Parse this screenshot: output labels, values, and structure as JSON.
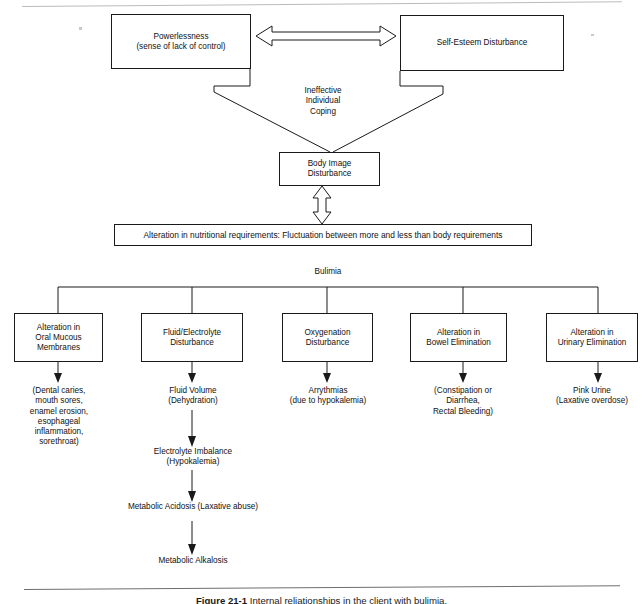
{
  "diagram": {
    "title_label": "Bulimia",
    "coping_label": "Ineffective\nIndividual\nCoping",
    "top_boxes": [
      {
        "name": "powerlessness",
        "text": "Powerlessness\n(sense of lack of control)"
      },
      {
        "name": "self-esteem-disturbance",
        "text": "Self-Esteem  Disturbance"
      }
    ],
    "body_image_box": {
      "name": "body-image-disturbance",
      "text": "Body Image\nDisturbance"
    },
    "nutrition_box": {
      "name": "alteration-nutritional-requirements",
      "text": "Alteration in nutritional requirements: Fluctuation between more and less than body requirements"
    },
    "branches": [
      {
        "name": "oral-mucous-membranes",
        "box": "Alteration in\nOral Mucous\nMembranes",
        "detail": "(Dental caries,\nmouth sores,\nenamel erosion,\nesophageal\ninflammation,\nsorethroat)"
      },
      {
        "name": "fluid-electrolyte-disturbance",
        "box": "Fluid/Electrolyte\nDisturbance",
        "detail": "Fluid Volume\n(Dehydration)"
      },
      {
        "name": "oxygenation-disturbance",
        "box": "Oxygenation\nDisturbance",
        "detail": "Arrythmias\n(due to hypokalemia)"
      },
      {
        "name": "bowel-elimination",
        "box": "Alteration in\nBowel Elimination",
        "detail": "(Constipation or\nDiarrhea,\nRectal Bleeding)"
      },
      {
        "name": "urinary-elimination",
        "box": "Alteration in\nUrinary Elimination",
        "detail": "Pink Urine\n(Laxative overdose)"
      }
    ],
    "fluid_chain": [
      {
        "name": "electrolyte-imbalance",
        "text": "Electrolyte Imbalance\n(Hypokalemia)"
      },
      {
        "name": "metabolic-acidosis",
        "text": "Metabolic Acidosis (Laxative abuse)"
      },
      {
        "name": "metabolic-alkalosis",
        "text": "Metabolic Alkalosis"
      }
    ],
    "caption": {
      "number": "Figure 21-1",
      "rest": " Internal reliationships in the client with bulimia."
    },
    "colors": {
      "line": "#1a1a1a",
      "background": "#ffffff",
      "rule": "#6d6f72"
    }
  }
}
